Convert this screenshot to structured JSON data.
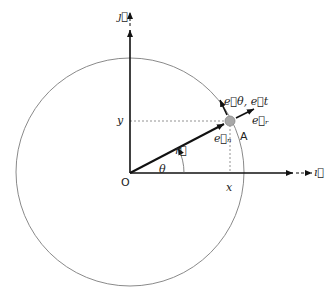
{
  "diagram": {
    "colors": {
      "axis": "#111111",
      "circle": "#8a8a8a",
      "dashed": "#777777",
      "point_fill": "#a8a8a8",
      "text": "#222222"
    },
    "labels": {
      "j_unit": "ȷ⃗",
      "i_unit": "ı⃗",
      "origin": "O",
      "x": "x",
      "y": "y",
      "theta": "θ",
      "r_vec": "r⃗",
      "e_n": "e⃗ₙ",
      "e_theta_t": "e⃗θ, e⃗t",
      "e_r": "e⃗ᵣ",
      "point": "A"
    },
    "geometry": {
      "origin": [
        130,
        173
      ],
      "circle_center": [
        130,
        172
      ],
      "circle_radius": 114,
      "point_A": [
        230,
        121
      ]
    }
  }
}
